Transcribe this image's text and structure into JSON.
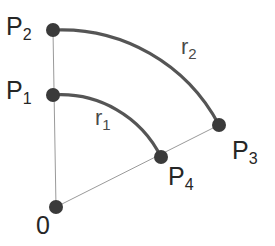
{
  "figure": {
    "background_color": "#ffffff",
    "width": 275,
    "height": 246
  },
  "style": {
    "arc_color": "#555555",
    "arc_width": 3.2,
    "radial_line_color": "#9a9a9a",
    "radial_line_width": 1.0,
    "point_color": "#3a3a3a",
    "point_radius": 7,
    "label_color": "#262626",
    "radius_label_color": "#4a4a4a"
  },
  "points": [
    {
      "id": "origin",
      "label_base": "0",
      "label_sub": "",
      "x": 56,
      "y": 207,
      "label_x": 36,
      "label_y": 213
    },
    {
      "id": "p1",
      "label_base": "P",
      "label_sub": "1",
      "x": 53,
      "y": 95,
      "label_x": 6,
      "label_y": 78
    },
    {
      "id": "p2",
      "label_base": "P",
      "label_sub": "2",
      "x": 53,
      "y": 30,
      "label_x": 6,
      "label_y": 14
    },
    {
      "id": "p3",
      "label_base": "P",
      "label_sub": "3",
      "x": 219,
      "y": 125,
      "label_x": 232,
      "label_y": 138
    },
    {
      "id": "p4",
      "label_base": "P",
      "label_sub": "4",
      "x": 161,
      "y": 157,
      "label_x": 168,
      "label_y": 164
    }
  ],
  "arcs": [
    {
      "id": "arc-r1",
      "label_base": "r",
      "label_sub": "1",
      "label_x": 95,
      "label_y": 107,
      "from_point": "p1",
      "to_point": "p4",
      "radius": 112,
      "path": "M 53 95 A 112 112 0 0 1 161 157"
    },
    {
      "id": "arc-r2",
      "label_base": "r",
      "label_sub": "2",
      "label_x": 181,
      "label_y": 36,
      "from_point": "p2",
      "to_point": "p3",
      "radius": 178,
      "path": "M 53 30 A 178 178 0 0 1 219 125"
    }
  ],
  "radial_lines": [
    {
      "id": "radial-origin-p2",
      "from_point": "origin",
      "to_point": "p2",
      "x1": 56,
      "y1": 207,
      "x2": 53,
      "y2": 30
    },
    {
      "id": "radial-origin-p3",
      "from_point": "origin",
      "to_point": "p3",
      "x1": 56,
      "y1": 207,
      "x2": 219,
      "y2": 125
    }
  ],
  "chart_data": {
    "type": "diagram",
    "origin": [
      56,
      207
    ],
    "arc_radii": {
      "r1": 112,
      "r2": 178
    },
    "labelled_points": [
      "0",
      "P1",
      "P2",
      "P3",
      "P4"
    ],
    "labelled_arcs": [
      "r1",
      "r2"
    ]
  }
}
